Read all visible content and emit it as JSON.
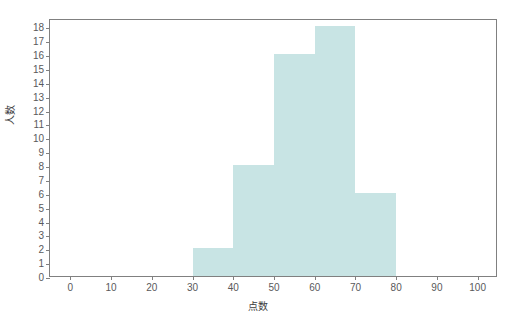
{
  "chart_data": {
    "type": "bar",
    "title": "",
    "subtitle": "",
    "xlabel": "点数",
    "ylabel": "人数",
    "bin_width": 10,
    "bin_edges": [
      0,
      10,
      20,
      30,
      40,
      50,
      60,
      70,
      80,
      90,
      100
    ],
    "categories": [
      "0-10",
      "10-20",
      "20-30",
      "30-40",
      "40-50",
      "50-60",
      "60-70",
      "70-80",
      "80-90",
      "90-100"
    ],
    "values": [
      0,
      0,
      0,
      2,
      8,
      16,
      18,
      6,
      0,
      0
    ],
    "bars": [
      {
        "label": "30-40",
        "x0": 30,
        "x1": 40,
        "value": 2
      },
      {
        "label": "40-50",
        "x0": 40,
        "x1": 50,
        "value": 8
      },
      {
        "label": "50-60",
        "x0": 50,
        "x1": 60,
        "value": 16
      },
      {
        "label": "60-70",
        "x0": 60,
        "x1": 70,
        "value": 18
      },
      {
        "label": "70-80",
        "x0": 70,
        "x1": 80,
        "value": 6
      }
    ],
    "xlim": [
      -5,
      105
    ],
    "ylim": [
      0,
      18.6
    ],
    "xticks": [
      0,
      10,
      20,
      30,
      40,
      50,
      60,
      70,
      80,
      90,
      100
    ],
    "xticklabels": [
      "0",
      "10",
      "20",
      "30",
      "40",
      "50",
      "60",
      "70",
      "80",
      "90",
      "100"
    ],
    "yticks": [
      0,
      1,
      2,
      3,
      4,
      5,
      6,
      7,
      8,
      9,
      10,
      11,
      12,
      13,
      14,
      15,
      16,
      17,
      18
    ],
    "yticklabels": [
      "0",
      "1",
      "2",
      "3",
      "4",
      "5",
      "6",
      "7",
      "8",
      "9",
      "10",
      "11",
      "12",
      "13",
      "14",
      "15",
      "16",
      "17",
      "18"
    ],
    "grid": false,
    "legend": null,
    "legend_position": "none",
    "colors": {
      "bar_fill": "#c8e4e4",
      "frame": "#808080",
      "tick_label": "#59595b",
      "axis_title": "#3c3c3e",
      "background": "#ffffff"
    }
  }
}
